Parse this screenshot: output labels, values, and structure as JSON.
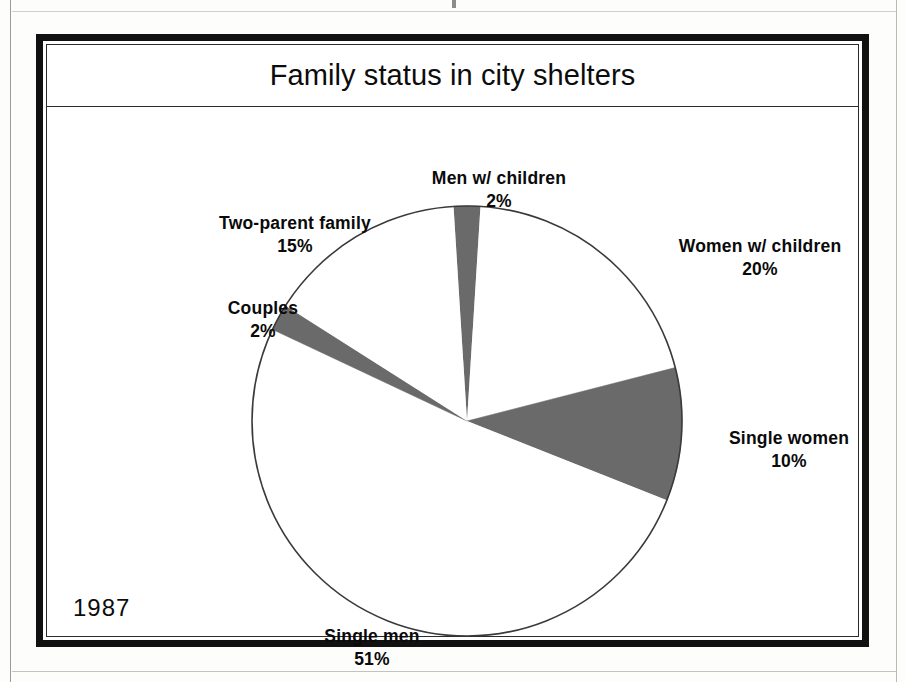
{
  "page": {
    "year_stamp": "1987"
  },
  "header": {
    "title": "Family status in city shelters"
  },
  "chart_data": {
    "type": "pie",
    "title": "Family status in city shelters",
    "xlabel": "",
    "ylabel": "",
    "legend": "none",
    "grid": false,
    "units": "percent",
    "start_angle_deg": -3.6,
    "direction": "clockwise",
    "categories": [
      "Men w/ children",
      "Women w/ children",
      "Single women",
      "Single men",
      "Couples",
      "Two-parent family"
    ],
    "values": [
      2,
      20,
      10,
      51,
      2,
      15
    ],
    "slices": [
      {
        "label": "Men w/ children",
        "value": 2,
        "pct_text": "2%",
        "fill": "#6a6a6a",
        "label_x": 452,
        "label_y": 60
      },
      {
        "label": "Women w/ children",
        "value": 20,
        "pct_text": "20%",
        "fill": "#ffffff",
        "label_x": 713,
        "label_y": 128
      },
      {
        "label": "Single women",
        "value": 10,
        "pct_text": "10%",
        "fill": "#6a6a6a",
        "label_x": 742,
        "label_y": 320
      },
      {
        "label": "Single men",
        "value": 51,
        "pct_text": "51%",
        "fill": "#ffffff",
        "label_x": 325,
        "label_y": 518
      },
      {
        "label": "Couples",
        "value": 2,
        "pct_text": "2%",
        "fill": "#6a6a6a",
        "label_x": 216,
        "label_y": 190
      },
      {
        "label": "Two-parent family",
        "value": 15,
        "pct_text": "15%",
        "fill": "#ffffff",
        "label_x": 248,
        "label_y": 105
      }
    ],
    "colors": {
      "slice_dark": "#6a6a6a",
      "slice_light": "#ffffff",
      "outline": "#3a3a3a",
      "text": "#0a0a0a"
    },
    "geometry": {
      "cx": 420,
      "cy": 314,
      "r": 215
    }
  }
}
